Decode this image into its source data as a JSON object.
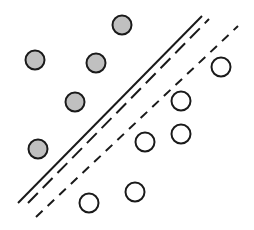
{
  "diagram": {
    "type": "svm-margin",
    "colors": {
      "positive_fill": "#c0c0c0",
      "negative_fill": "#ffffff",
      "stroke": "#1a1a1a",
      "background": "#ffffff"
    },
    "class_a_points": [
      {
        "x": 122,
        "y": 25
      },
      {
        "x": 35,
        "y": 60
      },
      {
        "x": 96,
        "y": 63
      },
      {
        "x": 75,
        "y": 102
      },
      {
        "x": 38,
        "y": 149
      }
    ],
    "class_b_points": [
      {
        "x": 221,
        "y": 67
      },
      {
        "x": 181,
        "y": 101
      },
      {
        "x": 181,
        "y": 134
      },
      {
        "x": 145,
        "y": 142
      },
      {
        "x": 135,
        "y": 192
      },
      {
        "x": 89,
        "y": 203
      }
    ],
    "lines": [
      {
        "name": "solid-boundary",
        "x1": 18,
        "y1": 203,
        "x2": 202,
        "y2": 16,
        "dash": ""
      },
      {
        "name": "long-dash-boundary",
        "x1": 28,
        "y1": 203,
        "x2": 209,
        "y2": 19,
        "dash": "14,7"
      },
      {
        "name": "short-dash-boundary",
        "x1": 36,
        "y1": 217,
        "x2": 238,
        "y2": 26,
        "dash": "9,7"
      }
    ],
    "point_radius": 9.5
  }
}
